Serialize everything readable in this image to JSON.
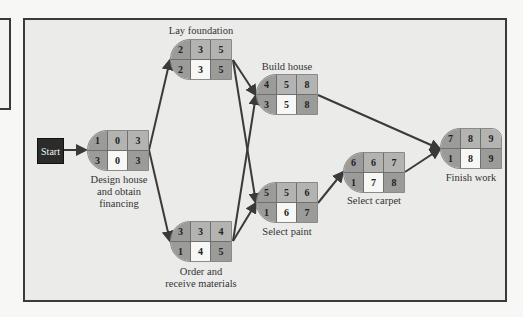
{
  "start": {
    "label": "Start"
  },
  "nodes": [
    {
      "id": "design",
      "name": "Design house and obtain financing",
      "label_lines": [
        "Design house",
        "and obtain",
        "financing"
      ],
      "top": [
        "1",
        "0",
        "3"
      ],
      "bottom": [
        "3",
        "0",
        "3"
      ]
    },
    {
      "id": "foundation",
      "name": "Lay foundation",
      "label_lines": [
        "Lay foundation"
      ],
      "top": [
        "2",
        "3",
        "5"
      ],
      "bottom": [
        "2",
        "3",
        "5"
      ]
    },
    {
      "id": "order",
      "name": "Order and receive materials",
      "label_lines": [
        "Order and",
        "receive materials"
      ],
      "top": [
        "3",
        "3",
        "4"
      ],
      "bottom": [
        "1",
        "4",
        "5"
      ]
    },
    {
      "id": "build",
      "name": "Build house",
      "label_lines": [
        "Build house"
      ],
      "top": [
        "4",
        "5",
        "8"
      ],
      "bottom": [
        "3",
        "5",
        "8"
      ]
    },
    {
      "id": "paint",
      "name": "Select paint",
      "label_lines": [
        "Select paint"
      ],
      "top": [
        "5",
        "5",
        "6"
      ],
      "bottom": [
        "1",
        "6",
        "7"
      ]
    },
    {
      "id": "carpet",
      "name": "Select carpet",
      "label_lines": [
        "Select carpet"
      ],
      "top": [
        "6",
        "6",
        "7"
      ],
      "bottom": [
        "1",
        "7",
        "8"
      ]
    },
    {
      "id": "finish",
      "name": "Finish work",
      "label_lines": [
        "Finish work"
      ],
      "top": [
        "7",
        "8",
        "9"
      ],
      "bottom": [
        "1",
        "8",
        "9"
      ]
    }
  ],
  "edges": [
    [
      "start",
      "design"
    ],
    [
      "design",
      "foundation"
    ],
    [
      "design",
      "order"
    ],
    [
      "foundation",
      "build"
    ],
    [
      "foundation",
      "paint"
    ],
    [
      "order",
      "build"
    ],
    [
      "order",
      "paint"
    ],
    [
      "build",
      "finish"
    ],
    [
      "paint",
      "carpet"
    ],
    [
      "carpet",
      "finish"
    ]
  ],
  "colors": {
    "frame": "#3a3a3a",
    "background": "#ebebea",
    "cell_dark": "#9b9b9a",
    "cell_mid": "#b3b3b2",
    "cell_light": "#f7f7f6",
    "arrow": "#3a3a3a",
    "start_box": "#2b2b2b"
  }
}
